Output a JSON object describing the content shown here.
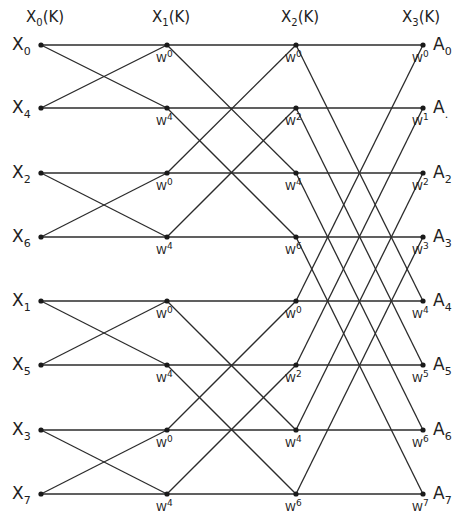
{
  "diagram": {
    "type": "fft-butterfly",
    "stroke_color": "#2b2b2b",
    "node_color": "#1a1a1a",
    "columns_x": [
      41,
      167,
      296,
      423
    ],
    "rows_y": [
      45,
      108,
      173,
      237,
      301,
      365,
      430,
      494
    ],
    "stage_headers": [
      {
        "base": "X",
        "sub": "0",
        "suffix": "(K)",
        "x": 36
      },
      {
        "base": "X",
        "sub": "1",
        "suffix": "(K)",
        "x": 162
      },
      {
        "base": "X",
        "sub": "2",
        "suffix": "(K)",
        "x": 291
      },
      {
        "base": "X",
        "sub": "3",
        "suffix": "(K)",
        "x": 412
      }
    ],
    "inputs": [
      {
        "base": "X",
        "sub": "0"
      },
      {
        "base": "X",
        "sub": "4"
      },
      {
        "base": "X",
        "sub": "2"
      },
      {
        "base": "X",
        "sub": "6"
      },
      {
        "base": "X",
        "sub": "1"
      },
      {
        "base": "X",
        "sub": "5"
      },
      {
        "base": "X",
        "sub": "3"
      },
      {
        "base": "X",
        "sub": "7"
      }
    ],
    "outputs": [
      {
        "base": "A",
        "sub": "0"
      },
      {
        "base": "A",
        "sub": "."
      },
      {
        "base": "A",
        "sub": "2"
      },
      {
        "base": "A",
        "sub": "3"
      },
      {
        "base": "A",
        "sub": "4"
      },
      {
        "base": "A",
        "sub": "5"
      },
      {
        "base": "A",
        "sub": "6"
      },
      {
        "base": "A",
        "sub": "7"
      }
    ],
    "twiddles": {
      "stage1": [
        "0",
        "4",
        "0",
        "4",
        "0",
        "4",
        "0",
        "4"
      ],
      "stage2": [
        "0",
        "2",
        "4",
        "6",
        "0",
        "2",
        "4",
        "6"
      ],
      "stage3": [
        "0",
        "1",
        "2",
        "3",
        "4",
        "5",
        "6",
        "7"
      ]
    },
    "twiddle_base": "W",
    "butterfly_spans": [
      1,
      2,
      4
    ]
  }
}
